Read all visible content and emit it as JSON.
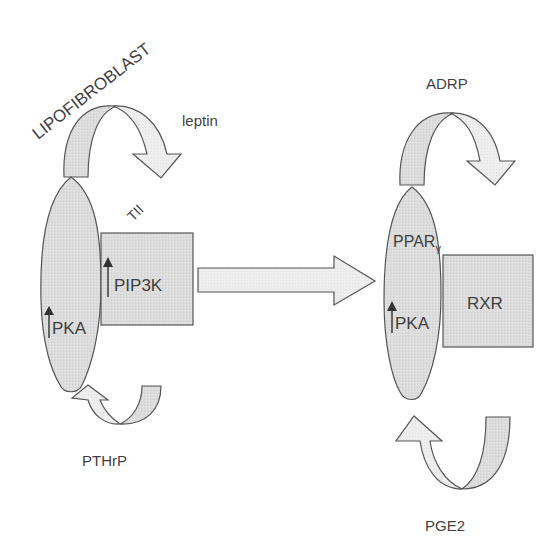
{
  "diagram": {
    "title_label": "LIPOFIBROBLAST",
    "colors": {
      "shape_fill": "#dcdcdc",
      "arrow_light_fill": "#eeeeee",
      "arrow_dark_fill": "#d6d6d6",
      "stroke": "#555555",
      "text": "#3f3f3f",
      "up_arrow": "#333333"
    },
    "left_cell": {
      "ellipse_labels": {
        "pka": "PKA"
      },
      "box_label": "PIP3K",
      "tii_label": "TII",
      "top_loop_label": "leptin",
      "bottom_loop_label": "PTHrP"
    },
    "right_cell": {
      "ellipse_labels": {
        "ppar": "PPAR",
        "ppar_subscript": "γ",
        "pka": "PKA"
      },
      "box_label": "RXR",
      "top_loop_label": "ADRP",
      "bottom_loop_label": "PGE2"
    },
    "indicators": {
      "up_arrow_icon": "up-arrow (increase)"
    }
  }
}
